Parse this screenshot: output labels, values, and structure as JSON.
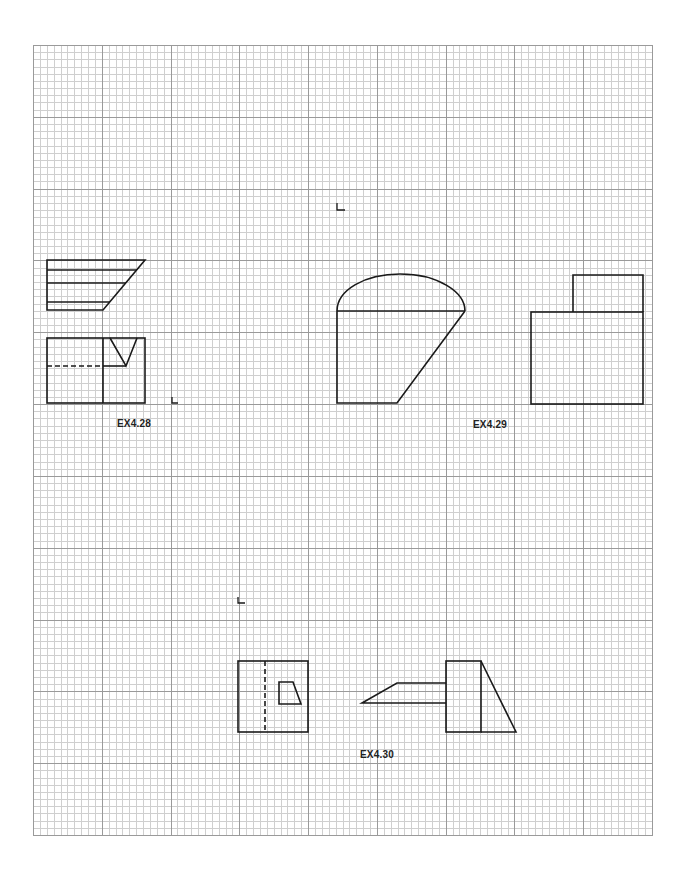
{
  "page": {
    "type": "graph-paper-drawing-exercises",
    "background_color": "#ffffff",
    "line_color": "#1a1a1a"
  },
  "grid": {
    "left": 33,
    "top": 45,
    "right": 652,
    "bottom": 835,
    "major_columns": 9,
    "major_rows": 11,
    "minor_per_major": 10,
    "major_color": "#9a9a9a",
    "minor_color": "#cfcfcf"
  },
  "exercises": [
    {
      "id": "ex4-28",
      "label": "EX4.28",
      "label_pos": {
        "x": 117,
        "y": 418
      }
    },
    {
      "id": "ex4-29",
      "label": "EX4.29",
      "label_pos": {
        "x": 473,
        "y": 419
      }
    },
    {
      "id": "ex4-30",
      "label": "EX4.30",
      "label_pos": {
        "x": 360,
        "y": 749
      }
    }
  ]
}
